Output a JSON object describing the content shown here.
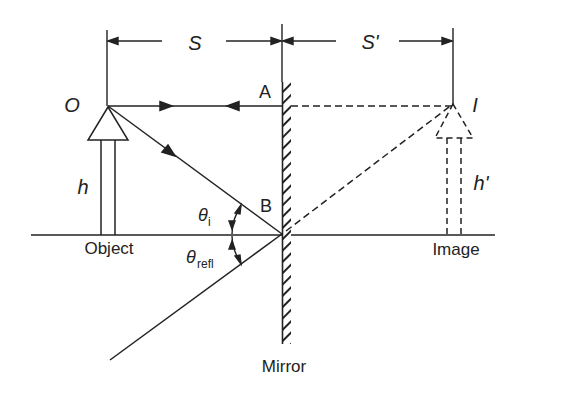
{
  "diagram": {
    "labels": {
      "object_point": "O",
      "image_point": "I",
      "point_a": "A",
      "point_b": "B",
      "object_distance": "S",
      "image_distance": "S'",
      "object_height": "h",
      "image_height": "h'",
      "object": "Object",
      "image": "Image",
      "mirror": "Mirror",
      "theta": "θ",
      "incident_sub": "i",
      "reflected_sub": "refl"
    },
    "colors": {
      "line": "#222222",
      "background": "#ffffff"
    }
  }
}
